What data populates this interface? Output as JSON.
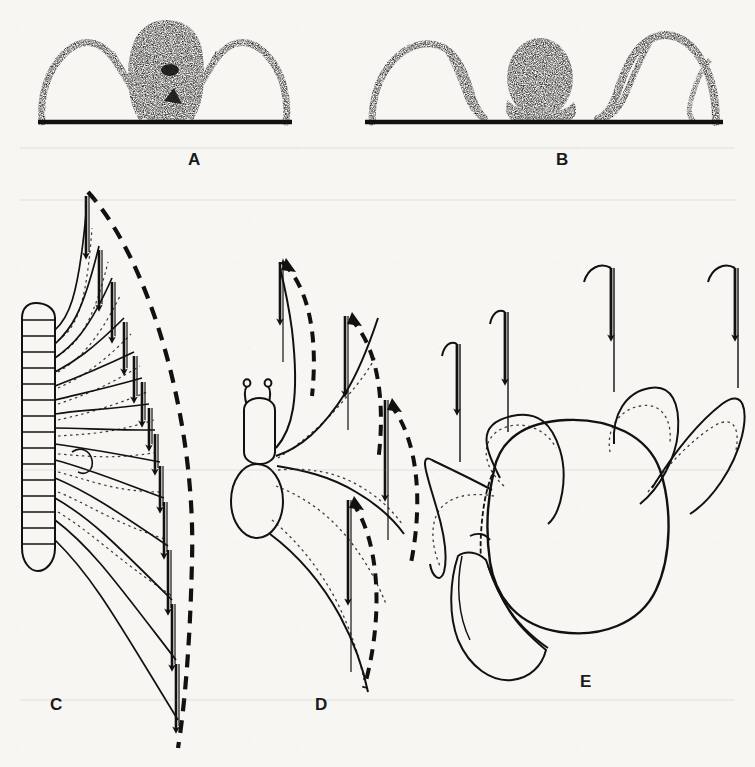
{
  "figure": {
    "kind": "scientific-line-figure",
    "medium": "scanned book plate, aged off-white paper",
    "background_color": "#f7f6f3",
    "ink_color": "#111111",
    "panels": [
      {
        "id": "A",
        "label": "A",
        "label_x": 195,
        "label_y": 152,
        "type": "stippled-silhouette",
        "subject": "spider seen end-on, standing on a ground line",
        "body_style": "dense stippled dark ovoid body with two down-curved flanking limbs",
        "ground_line": {
          "x1": 38,
          "x2": 292,
          "y": 122,
          "thickness": 4
        },
        "leg_count_visible": 4,
        "notes": "legs arch high above the body level then drop steeply to the substrate"
      },
      {
        "id": "B",
        "label": "B",
        "label_x": 563,
        "label_y": 152,
        "type": "stippled-silhouette",
        "subject": "arthropod seen end-on with rounder, lower-slung stippled body",
        "body_style": "rounded stippled body sitting close to the ground between two leg arches",
        "ground_line": {
          "x1": 365,
          "x2": 723,
          "y": 122,
          "thickness": 4
        },
        "leg_count_visible": 4,
        "notes": "leg arches are lower and broader than in A"
      },
      {
        "id": "C",
        "label": "C",
        "label_x": 57,
        "label_y": 697,
        "type": "leg-stroke-diagram",
        "subject": "centipede / many-legged myriapod, dorsal view of left side",
        "body": {
          "shape": "elongate segmented trunk",
          "segment_count": 16,
          "x": 18,
          "y_top": 305,
          "width": 38,
          "y_bottom": 568
        },
        "leg_count": 13,
        "stroke_arrow_direction": "downward (backward propulsive stroke)",
        "boundary": "single large dashed arc sweeping from the top apex around to the bottom",
        "notes": "each leg tip carries a vertical solid arrow; arrow length grows toward the rear"
      },
      {
        "id": "D",
        "label": "D",
        "label_x": 322,
        "label_y": 697,
        "type": "leg-stroke-diagram",
        "subject": "insect, dorsal view of left side",
        "body": {
          "shape": "head with two antennae, thorax, rounded abdomen",
          "x": 238,
          "y_top": 400,
          "width": 46,
          "y_bottom": 540
        },
        "leg_count": 4,
        "stroke_arrow_direction": "downward (backward propulsive stroke)",
        "boundary": "four separate dashed return loops, one per leg",
        "notes": "solid arrow is the power stroke, dashed loop is the recovery swing"
      },
      {
        "id": "E",
        "label": "E",
        "label_x": 587,
        "label_y": 674,
        "type": "leg-stroke-diagram",
        "subject": "crab, dorsal view of left side",
        "body": {
          "shape": "broad rounded carapace with one large chela (claw) at lower left",
          "x": 470,
          "y_top": 400,
          "width": 185,
          "y_bottom": 625
        },
        "leg_count": 4,
        "stroke_arrow_direction": "downward (sideways-walking stroke)",
        "boundary": "faint dotted recovery arcs under each leg",
        "notes": "legs splay widely; strokes are short relative to leg length"
      }
    ]
  }
}
